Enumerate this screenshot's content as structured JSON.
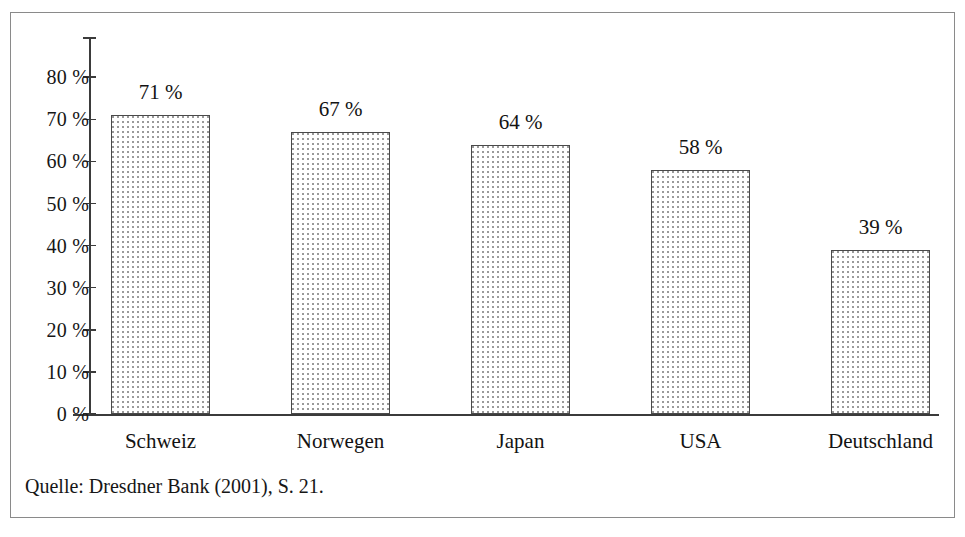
{
  "figure": {
    "source_note": "Quelle: Dresdner Bank (2001), S. 21."
  },
  "chart_data": {
    "type": "bar",
    "title": "",
    "subtitle": "",
    "xlabel": "",
    "ylabel": "",
    "categories": [
      "Schweiz",
      "Norwegen",
      "Japan",
      "USA",
      "Deutschland"
    ],
    "values": [
      71,
      67,
      64,
      58,
      39
    ],
    "value_labels": [
      "71 %",
      "67 %",
      "64 %",
      "58 %",
      "39 %"
    ],
    "unit": "%",
    "ylim": [
      0,
      85
    ],
    "ytick_values": [
      0,
      10,
      20,
      30,
      40,
      50,
      60,
      70,
      80
    ],
    "ytick_labels": [
      "0 %",
      "10 %",
      "20 %",
      "30 %",
      "40 %",
      "50 %",
      "60 %",
      "70 %",
      "80 %"
    ],
    "grid": false,
    "legend": "none",
    "bar_fill": "#ffffff",
    "bar_pattern": "fine-dotted",
    "bar_border_color": "#4a4a4a",
    "axis_color": "#3b3b3b",
    "background": "#ffffff"
  }
}
